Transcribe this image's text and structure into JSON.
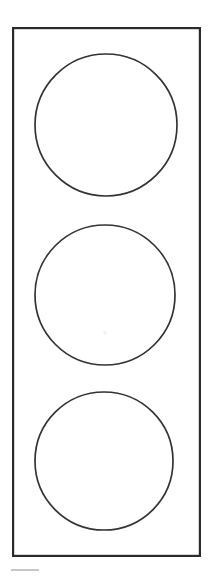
{
  "figure": {
    "title": "Traffic Light",
    "style": "line-art-outline",
    "background_color": "#ffffff",
    "stroke_color": "#2b2b2b",
    "fill_color": "#ffffff",
    "canvas_width": 213,
    "canvas_height": 577,
    "orientation": "vertical"
  },
  "housing": {
    "name": "traffic-light-housing",
    "shape": "rectangle",
    "x": 12,
    "y": 27,
    "width": 189,
    "height": 530,
    "stroke_color": "#2b2b2b",
    "stroke_width": 2.2,
    "fill_color": "#ffffff"
  },
  "lamps": [
    {
      "position": "top",
      "label": "Red",
      "state": "off",
      "cx": 106,
      "cy": 125,
      "r": 71,
      "stroke_color": "#333333",
      "stroke_width": 1.7,
      "fill_color": "#ffffff"
    },
    {
      "position": "middle",
      "label": "Amber",
      "state": "off",
      "cx": 105,
      "cy": 295,
      "r": 70,
      "stroke_color": "#333333",
      "stroke_width": 1.7,
      "fill_color": "#ffffff"
    },
    {
      "position": "bottom",
      "label": "Green",
      "state": "off",
      "cx": 104,
      "cy": 461,
      "r": 69,
      "stroke_color": "#333333",
      "stroke_width": 1.7,
      "fill_color": "#ffffff"
    }
  ],
  "artifacts": {
    "smudge": {
      "name": "scan-smudge",
      "cx": 105,
      "cy": 333,
      "r": 2,
      "color": "#f2f2f2"
    },
    "footer_tick": {
      "name": "footer-tick-mark",
      "x1": 11,
      "y1": 570,
      "x2": 39,
      "y2": 570,
      "color": "#b9b9b9"
    }
  }
}
